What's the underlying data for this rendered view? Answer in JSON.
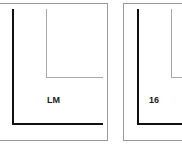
{
  "panels": [
    {
      "label": "LM"
    },
    {
      "label": "16"
    }
  ],
  "colors": {
    "frame": "#9a9a9a",
    "axis": "#111111",
    "inner": "#a8a8a8",
    "background": "#ffffff"
  }
}
